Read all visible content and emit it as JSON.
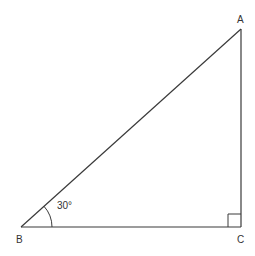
{
  "diagram": {
    "type": "right-triangle",
    "colors": {
      "stroke": "#3a3a3a",
      "text": "#333333",
      "background": "#ffffff"
    },
    "vertices": {
      "A": {
        "label": "A",
        "x": 241,
        "y": 29
      },
      "B": {
        "label": "B",
        "x": 21,
        "y": 227
      },
      "C": {
        "label": "C",
        "x": 241,
        "y": 227
      }
    },
    "angle_B": {
      "label": "30°",
      "degrees": 30
    },
    "right_angle_at": "C"
  }
}
